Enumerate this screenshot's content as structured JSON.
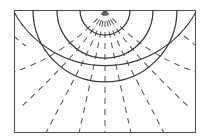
{
  "figure": {
    "type": "field-line-flow-net",
    "background_color": "#ffffff",
    "line_color_solid": "#3a3a3a",
    "line_color_dashed": "#5a5a5a",
    "frame_color": "#555555"
  },
  "canvas": {
    "width": 210,
    "height": 140
  },
  "frame": {
    "x": 14,
    "y": 10,
    "width": 182,
    "height": 123
  },
  "geometry": {
    "center_x": 105,
    "center_y": 10,
    "solid_arc_radii": [
      15,
      38,
      72,
      112
    ],
    "dashed_arc_radii": [
      26,
      55,
      92
    ],
    "flux_line_angles_deg": [
      14,
      32,
      50,
      68,
      90,
      112,
      130,
      148,
      166
    ],
    "dash_pattern": "6,5"
  },
  "elements": {
    "frame_name": "diagram-frame",
    "equipotential_group": "equipotential-arcs",
    "flux_group": "flux-lines",
    "axis_name": "center-axis"
  }
}
